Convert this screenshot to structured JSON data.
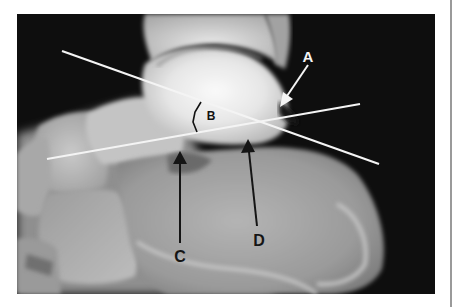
{
  "image": {
    "description": "Lateral radiograph of the hindfoot with two reference lines and labelled annotations",
    "background_color": "#0d0d0d",
    "line_color": "#f4f4f4",
    "arrow_dark_color": "#151515",
    "arrow_light_color": "#f4f4f4"
  },
  "annotations": {
    "A": {
      "label": "A",
      "arrow": "white",
      "direction": "down-left"
    },
    "B": {
      "label": "B",
      "type": "angle-bracket"
    },
    "C": {
      "label": "C",
      "arrow": "black",
      "direction": "up"
    },
    "D": {
      "label": "D",
      "arrow": "black",
      "direction": "up"
    }
  }
}
